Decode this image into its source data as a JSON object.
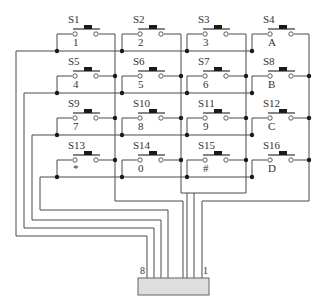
{
  "diagram": {
    "switches": [
      {
        "id": "S1",
        "key": "1",
        "row": 0,
        "col": 0
      },
      {
        "id": "S2",
        "key": "2",
        "row": 0,
        "col": 1
      },
      {
        "id": "S3",
        "key": "3",
        "row": 0,
        "col": 2
      },
      {
        "id": "S4",
        "key": "A",
        "row": 0,
        "col": 3
      },
      {
        "id": "S5",
        "key": "4",
        "row": 1,
        "col": 0
      },
      {
        "id": "S6",
        "key": "5",
        "row": 1,
        "col": 1
      },
      {
        "id": "S7",
        "key": "6",
        "row": 1,
        "col": 2
      },
      {
        "id": "S8",
        "key": "B",
        "row": 1,
        "col": 3
      },
      {
        "id": "S9",
        "key": "7",
        "row": 2,
        "col": 0
      },
      {
        "id": "S10",
        "key": "8",
        "row": 2,
        "col": 1
      },
      {
        "id": "S11",
        "key": "9",
        "row": 2,
        "col": 2
      },
      {
        "id": "S12",
        "key": "C",
        "row": 2,
        "col": 3
      },
      {
        "id": "S13",
        "key": "*",
        "row": 3,
        "col": 0
      },
      {
        "id": "S14",
        "key": "0",
        "row": 3,
        "col": 1
      },
      {
        "id": "S15",
        "key": "#",
        "row": 3,
        "col": 2
      },
      {
        "id": "S16",
        "key": "D",
        "row": 3,
        "col": 3
      }
    ],
    "connector": {
      "pin_first_label": "1",
      "pin_last_label": "8",
      "pin_count": 8
    },
    "colors": {
      "wire": "#4a4a4a",
      "junction": "#1a1a1a",
      "connector_fill": "#dedede"
    }
  }
}
